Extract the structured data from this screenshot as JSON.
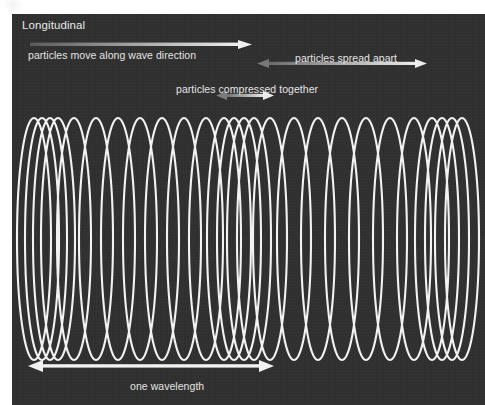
{
  "figure": {
    "title": "Longitudinal",
    "background_color": "#2f2f2f",
    "page_color": "#ffffff",
    "wave_color": "#f2f2f2",
    "text_color": "#e4e4e4",
    "arrow_color": "#c9c9c9"
  },
  "annotations": [
    {
      "id": "wave-direction",
      "label": "particles move along wave direction",
      "arrow_type": "single-headed-right",
      "arrow_style": "gradient",
      "label_x": 16,
      "label_y": 35,
      "arrow_x": 18,
      "arrow_y": 26,
      "arrow_width": 222,
      "arrow_head": "right"
    },
    {
      "id": "spread-apart",
      "label": "particles spread apart",
      "arrow_type": "double-headed",
      "arrow_style": "gradient",
      "label_x": 283,
      "label_y": 38,
      "arrow_x": 245,
      "arrow_y": 45,
      "arrow_width": 170,
      "arrow_head": "both"
    },
    {
      "id": "compressed-together",
      "label": "particles compressed together",
      "arrow_type": "double-headed",
      "arrow_style": "gradient",
      "label_x": 164,
      "label_y": 69,
      "arrow_x": 204,
      "arrow_y": 77,
      "arrow_width": 58,
      "arrow_head": "both"
    },
    {
      "id": "one-wavelength",
      "label": "one wavelength",
      "arrow_type": "double-headed",
      "arrow_style": "solid",
      "label_x": 118,
      "label_y": 366,
      "arrow_x": 16,
      "arrow_y": 346,
      "arrow_width": 246,
      "arrow_head": "both"
    }
  ],
  "chart_data": {
    "type": "line",
    "title": "Longitudinal",
    "xlabel": "",
    "ylabel": "",
    "grid": false,
    "legend": "none",
    "xlim": [
      0,
      473
    ],
    "ylim": [
      0,
      391
    ],
    "coil": {
      "top_y": 104,
      "bottom_y": 346,
      "loop_half_width": 17,
      "stroke_width": 2.1,
      "centers": [
        22,
        30,
        38,
        46,
        62,
        84,
        106,
        128,
        150,
        172,
        194,
        212,
        222,
        232,
        242,
        258,
        282,
        306,
        330,
        354,
        378,
        402,
        420,
        430,
        440,
        450
      ],
      "regions": [
        {
          "name": "compression",
          "x_start": 22,
          "x_end": 46
        },
        {
          "name": "rarefaction",
          "x_start": 46,
          "x_end": 194
        },
        {
          "name": "compression",
          "x_start": 194,
          "x_end": 242
        },
        {
          "name": "rarefaction",
          "x_start": 242,
          "x_end": 402
        },
        {
          "name": "compression",
          "x_start": 402,
          "x_end": 450
        }
      ]
    }
  }
}
